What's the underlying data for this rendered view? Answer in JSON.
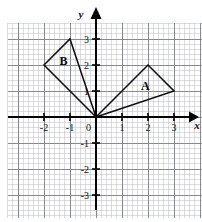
{
  "figure": {
    "kind": "coordinate-plane-with-triangles",
    "background": "#ffffff",
    "grid": {
      "minor_color": "#b9bcc4",
      "major_color": "#7d818a",
      "minor_per_unit": 5,
      "x_range": [
        -3.4,
        4.1
      ],
      "y_range": [
        -3.9,
        3.6
      ],
      "show": true
    },
    "axes": {
      "color": "#000000",
      "x_label": "x",
      "y_label": "y",
      "origin_label": "0",
      "x_ticks": [
        -2,
        -1,
        1,
        2,
        3
      ],
      "x_tick_labels": [
        "-2",
        "-1",
        "1",
        "2",
        "3"
      ],
      "y_ticks": [
        3,
        2,
        1,
        -1,
        -2,
        -3
      ],
      "y_tick_labels": [
        "3",
        "2",
        "1",
        "-1",
        "-2",
        "-3"
      ],
      "arrowheads": [
        "x-positive",
        "y-positive"
      ]
    }
  },
  "chart_data": {
    "type": "scatter",
    "title": "",
    "xlabel": "x",
    "ylabel": "y",
    "xlim": [
      -3.4,
      4.1
    ],
    "ylim": [
      -3.9,
      3.6
    ],
    "grid": true,
    "legend": "none",
    "xticks": [
      -2,
      -1,
      0,
      1,
      2,
      3
    ],
    "yticks": [
      -3,
      -2,
      -1,
      0,
      1,
      2,
      3
    ],
    "series": [
      {
        "name": "A",
        "shape": "triangle",
        "label": "A",
        "label_position": [
          1.9,
          1.05
        ],
        "stroke": "#0b0b0b",
        "fill": "none",
        "closed": true,
        "vertices": [
          [
            0,
            0
          ],
          [
            2,
            2
          ],
          [
            3,
            1
          ]
        ]
      },
      {
        "name": "B",
        "shape": "triangle",
        "label": "B",
        "label_position": [
          -1.25,
          2.0
        ],
        "stroke": "#0b0b0b",
        "fill": "none",
        "closed": true,
        "vertices": [
          [
            0,
            0
          ],
          [
            -1,
            3
          ],
          [
            -2,
            2
          ]
        ]
      }
    ],
    "annotations": [
      {
        "text": "A",
        "x": 1.9,
        "y": 1.05
      },
      {
        "text": "B",
        "x": -1.25,
        "y": 2.0
      },
      {
        "text": "0",
        "x": -0.22,
        "y": -0.33
      }
    ]
  }
}
